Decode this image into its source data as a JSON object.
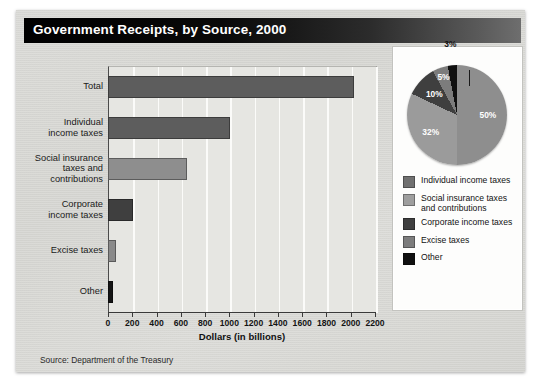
{
  "title": "Government Receipts, by Source, 2000",
  "source": "Source:  Department of the Treasury",
  "chart_data": {
    "type": "bar",
    "title": "Government Receipts, by Source, 2000",
    "xlabel": "Dollars (in billions)",
    "ylabel": "",
    "xlim": [
      0,
      2200
    ],
    "xticks": [
      0,
      200,
      400,
      600,
      800,
      1000,
      1200,
      1400,
      1600,
      1800,
      2000,
      2200
    ],
    "xtick_labels": [
      "0",
      "200",
      "400",
      "600",
      "800",
      "1000",
      "1200",
      "1400",
      "1600",
      "1800",
      "2000",
      "2200"
    ],
    "grid": true,
    "legend_position": "right-panel",
    "categories": [
      "Total",
      "Individual\nincome taxes",
      "Social insurance\ntaxes and\ncontributions",
      "Corporate\nincome taxes",
      "Excise taxes",
      "Other"
    ],
    "values": [
      2025,
      1004,
      652,
      207,
      69,
      44
    ],
    "bar_colors": [
      "#5d5d5d",
      "#5d5d5d",
      "#8e8e8e",
      "#3f3f3f",
      "#8a8a8a",
      "#151515"
    ],
    "source": "Source:  Department of the Treasury"
  },
  "pie_data": {
    "type": "pie",
    "labels": [
      "Individual income taxes",
      "Social insurance taxes and contributions",
      "Corporate income taxes",
      "Excise taxes",
      "Other"
    ],
    "values": [
      50,
      32,
      10,
      5,
      3
    ],
    "value_labels": [
      "50%",
      "32%",
      "10%",
      "5%",
      "3%"
    ],
    "colors": [
      "#8e8e8e",
      "#9b9b9b",
      "#3f3f3f",
      "#7c7c7c",
      "#101010"
    ]
  },
  "legend": {
    "items": [
      {
        "label": "Individual income taxes",
        "color": "#707070"
      },
      {
        "label": "Social insurance taxes\nand contributions",
        "color": "#9e9e9e"
      },
      {
        "label": "Corporate income taxes",
        "color": "#3f3f3f"
      },
      {
        "label": "Excise taxes",
        "color": "#7c7c7c"
      },
      {
        "label": "Other",
        "color": "#101010"
      }
    ]
  }
}
